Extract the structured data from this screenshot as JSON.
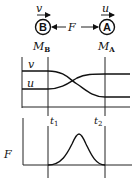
{
  "diagram": {
    "ball_b": {
      "letter": "B",
      "mass_label": "M",
      "mass_sub": "B",
      "velocity_label": "v"
    },
    "ball_a": {
      "letter": "A",
      "mass_label": "M",
      "mass_sub": "A",
      "velocity_label": "u"
    },
    "force_label": "F"
  },
  "velocity_graph": {
    "curve_labels": [
      "v",
      "u"
    ],
    "time_labels": [
      {
        "main": "t",
        "sub": "1"
      },
      {
        "main": "t",
        "sub": "2"
      }
    ]
  },
  "force_graph": {
    "axis_label": "F"
  }
}
